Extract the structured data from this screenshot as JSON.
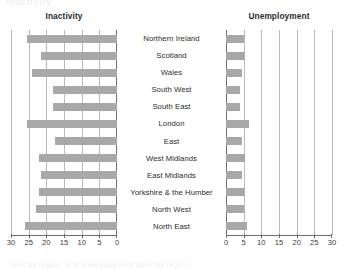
{
  "figure": {
    "clipped_top_text": "Inactivity",
    "clipped_bottom_text": "rates by region, and unemployment rates by region"
  },
  "chart_data": [
    {
      "type": "bar",
      "orientation": "horizontal",
      "title": "Inactivity",
      "xlabel": "",
      "ylabel": "",
      "xlim": [
        30,
        0
      ],
      "reversed_axis": true,
      "grid": true,
      "ticks": [
        30,
        25,
        20,
        15,
        10,
        5,
        0
      ],
      "legend": "none",
      "bar_color": "#a8a8a8",
      "categories": [
        "Northern Ireland",
        "Scotland",
        "Wales",
        "South West",
        "South East",
        "London",
        "East",
        "West Midlands",
        "East Midlands",
        "Yorkshire & the Humber",
        "North West",
        "North East"
      ],
      "values": [
        25.5,
        21.5,
        24.0,
        18.0,
        18.0,
        25.5,
        17.5,
        22.0,
        21.5,
        22.0,
        23.0,
        26.0
      ]
    },
    {
      "type": "bar",
      "orientation": "horizontal",
      "title": "Unemployment",
      "xlabel": "",
      "ylabel": "",
      "xlim": [
        0,
        30
      ],
      "reversed_axis": false,
      "grid": true,
      "ticks": [
        0,
        5,
        10,
        15,
        20,
        25,
        30
      ],
      "legend": "none",
      "bar_color": "#a8a8a8",
      "categories": [
        "Northern Ireland",
        "Scotland",
        "Wales",
        "South West",
        "South East",
        "London",
        "East",
        "West Midlands",
        "East Midlands",
        "Yorkshire & the Humber",
        "North West",
        "North East"
      ],
      "values": [
        5.0,
        5.5,
        4.5,
        4.0,
        4.0,
        6.5,
        4.5,
        5.5,
        4.5,
        5.5,
        5.0,
        6.0
      ]
    }
  ]
}
